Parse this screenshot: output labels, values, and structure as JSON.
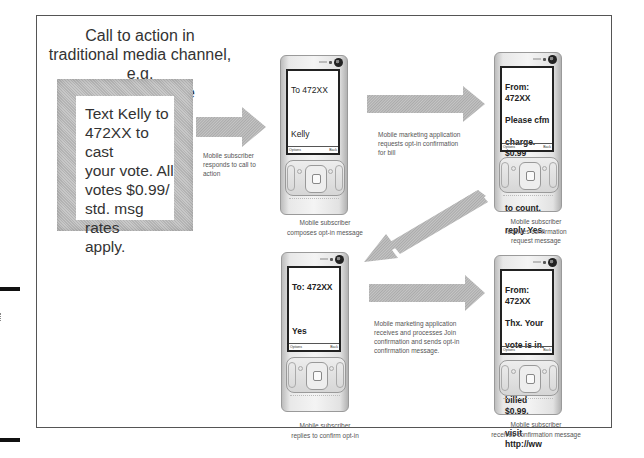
{
  "diagram": {
    "title_lines": [
      "Call to action in",
      "traditional media channel, e.g.",
      "TV, to cast vote"
    ],
    "poster": {
      "lines": [
        "Text Kelly to",
        "472XX to cast",
        "your vote.  All",
        "votes $0.99/",
        "std. msg rates",
        "apply."
      ]
    },
    "steps": [
      {
        "arrow_caption": [
          "Mobile subscriber",
          "responds to call to",
          "action"
        ],
        "phone_screen": [
          "To 472XX",
          "",
          "Kelly"
        ],
        "phone_caption": [
          "Mobile subscriber",
          "composes opt-in message"
        ]
      },
      {
        "arrow_caption": [
          "Mobile marketing application",
          "requests opt-in confirmation",
          "for bill"
        ],
        "phone_screen": [
          "From: 472XX",
          "Please cfm",
          "charge. $0.99",
          "for your vote",
          "to count.",
          "reply Yes."
        ],
        "phone_caption": [
          "Mobile subscriber",
          "receives confirmation",
          "request message"
        ]
      },
      {
        "arrow_caption": [],
        "phone_screen": [
          "To: 472XX",
          "",
          "Yes"
        ],
        "phone_caption": [
          "Mobile subscriber",
          "replies to confirm opt-in"
        ]
      },
      {
        "arrow_caption": [
          "Mobile marketing application",
          "receives and processes Join",
          "confirmation and sends opt-in",
          "confirmation message."
        ],
        "phone_screen": [
          "From: 472XX",
          "Thx. Your",
          "vote is in.",
          "You've been",
          "billed $0.99.",
          "visit http://ww"
        ],
        "phone_caption": [
          "Mobile subscriber",
          "receives confirmation message"
        ]
      }
    ],
    "softkeys": {
      "left": "Options",
      "right": "Back"
    },
    "colors": {
      "arrow": "#b9b9b9",
      "frame": "#555555",
      "poster": "#c0c0c0"
    }
  }
}
